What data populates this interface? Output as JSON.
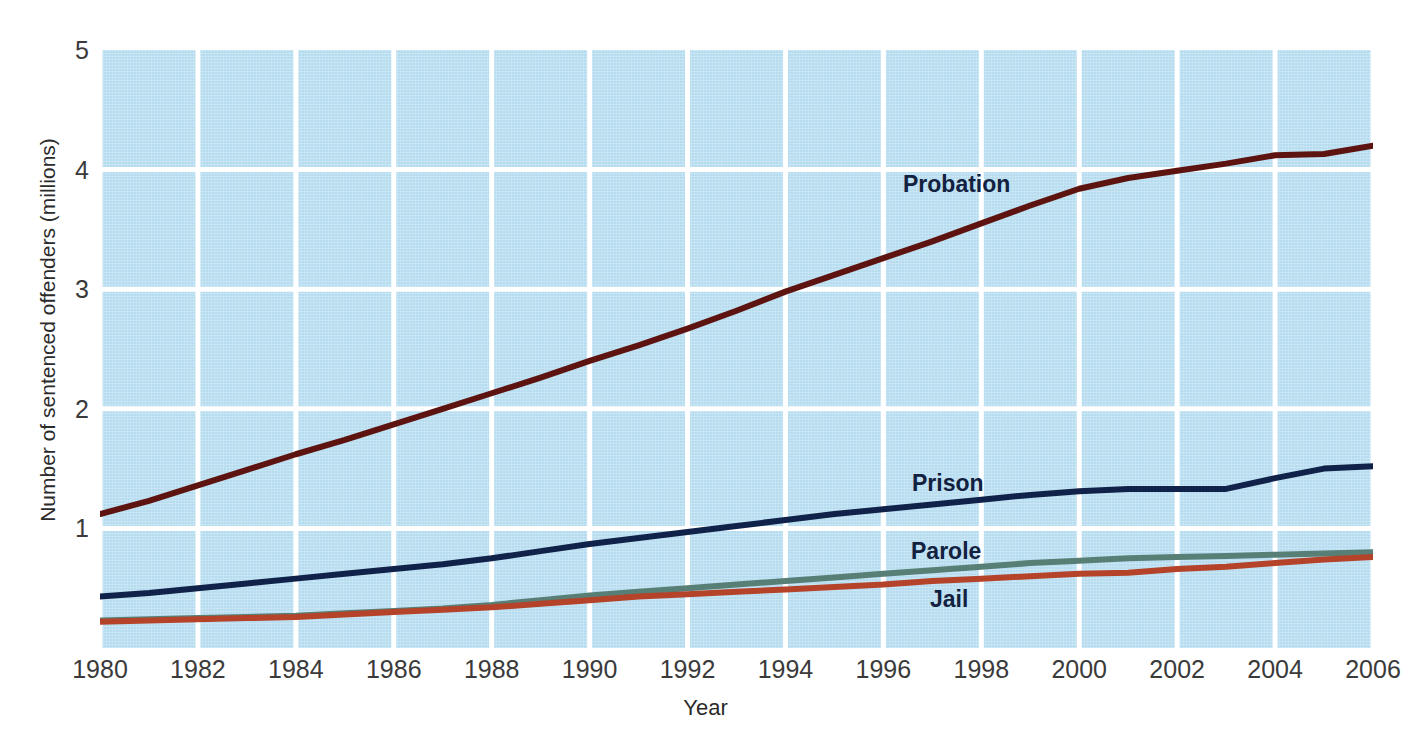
{
  "chart_data": {
    "type": "line",
    "title": "",
    "xlabel": "Year",
    "ylabel": "Number of sentenced offenders (millions)",
    "xlim": [
      1980,
      2006
    ],
    "ylim": [
      0,
      5
    ],
    "xticks": [
      1980,
      1982,
      1984,
      1986,
      1988,
      1990,
      1992,
      1994,
      1996,
      1998,
      2000,
      2002,
      2004,
      2006
    ],
    "yticks": [
      1,
      2,
      3,
      4,
      5
    ],
    "grid": true,
    "legend_position": "inline-labels",
    "plot_background": "#b6dcf0",
    "gridline_color": "#ffffff",
    "x": [
      1980,
      1981,
      1982,
      1983,
      1984,
      1985,
      1986,
      1987,
      1988,
      1989,
      1990,
      1991,
      1992,
      1993,
      1994,
      1995,
      1996,
      1997,
      1998,
      1999,
      2000,
      2001,
      2002,
      2003,
      2004,
      2005,
      2006
    ],
    "series": [
      {
        "name": "Probation",
        "color": "#5d1410",
        "values": [
          1.12,
          1.23,
          1.36,
          1.49,
          1.62,
          1.74,
          1.87,
          2.0,
          2.13,
          2.26,
          2.4,
          2.53,
          2.67,
          2.82,
          2.98,
          3.12,
          3.26,
          3.4,
          3.55,
          3.7,
          3.84,
          3.93,
          3.99,
          4.05,
          4.12,
          4.13,
          4.2
        ]
      },
      {
        "name": "Prison",
        "color": "#10224a",
        "values": [
          0.43,
          0.46,
          0.5,
          0.54,
          0.58,
          0.62,
          0.66,
          0.7,
          0.75,
          0.81,
          0.87,
          0.92,
          0.97,
          1.02,
          1.07,
          1.12,
          1.16,
          1.2,
          1.24,
          1.28,
          1.31,
          1.33,
          1.33,
          1.33,
          1.42,
          1.5,
          1.52
        ]
      },
      {
        "name": "Parole",
        "color": "#587f76",
        "values": [
          0.23,
          0.24,
          0.25,
          0.26,
          0.27,
          0.29,
          0.31,
          0.33,
          0.36,
          0.4,
          0.44,
          0.47,
          0.5,
          0.53,
          0.56,
          0.59,
          0.62,
          0.65,
          0.68,
          0.71,
          0.73,
          0.75,
          0.76,
          0.77,
          0.78,
          0.79,
          0.8
        ]
      },
      {
        "name": "Jail",
        "color": "#b4432a",
        "values": [
          0.22,
          0.23,
          0.24,
          0.25,
          0.26,
          0.28,
          0.3,
          0.32,
          0.34,
          0.37,
          0.4,
          0.43,
          0.45,
          0.47,
          0.49,
          0.51,
          0.53,
          0.56,
          0.58,
          0.6,
          0.62,
          0.63,
          0.66,
          0.68,
          0.71,
          0.74,
          0.76
        ]
      }
    ],
    "annotations": [
      {
        "text": "Probation",
        "x_px": 903,
        "y_px": 173
      },
      {
        "text": "Prison",
        "x_px": 912,
        "y_px": 472
      },
      {
        "text": "Parole",
        "x_px": 911,
        "y_px": 540
      },
      {
        "text": "Jail",
        "x_px": 930,
        "y_px": 588
      }
    ]
  }
}
